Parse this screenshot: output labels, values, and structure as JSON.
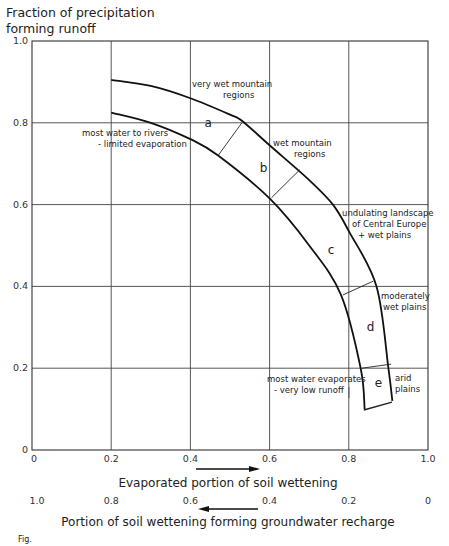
{
  "chart_data": {
    "type": "line",
    "title": "",
    "ylabel_lines": [
      "Fraction of precipitation",
      "forming runoff"
    ],
    "xlabel": "Evaporated portion of soil wettening",
    "x2label": "Portion of soil wettening forming groundwater recharge",
    "xlim": [
      0,
      1.0
    ],
    "ylim": [
      0,
      1.0
    ],
    "grid": true,
    "y_ticks": [
      "1.0",
      "0.8",
      "0.6",
      "0.4",
      "0.2",
      "0"
    ],
    "x_ticks": [
      "0",
      "0.2",
      "0.4",
      "0.6",
      "0.8",
      "1.0"
    ],
    "x2_ticks": [
      "1.0",
      "0.8",
      "0.6",
      "0.4",
      "0.2",
      "0"
    ],
    "x_arrow_direction": "right",
    "x2_arrow_direction": "left",
    "series": [
      {
        "name": "upper boundary",
        "x": [
          0.2,
          0.3,
          0.4,
          0.5,
          0.53,
          0.6,
          0.7,
          0.76,
          0.8,
          0.87,
          0.9,
          0.91
        ],
        "y": [
          0.905,
          0.89,
          0.86,
          0.82,
          0.805,
          0.745,
          0.66,
          0.6,
          0.535,
          0.4,
          0.2,
          0.12
        ]
      },
      {
        "name": "lower boundary",
        "x": [
          0.2,
          0.3,
          0.4,
          0.47,
          0.6,
          0.7,
          0.78,
          0.83,
          0.84
        ],
        "y": [
          0.825,
          0.8,
          0.76,
          0.72,
          0.615,
          0.5,
          0.38,
          0.2,
          0.1
        ]
      }
    ],
    "zones": [
      {
        "label": "a",
        "x": 0.445,
        "y": 0.79
      },
      {
        "label": "b",
        "x": 0.585,
        "y": 0.68
      },
      {
        "label": "c",
        "x": 0.755,
        "y": 0.48
      },
      {
        "label": "d",
        "x": 0.855,
        "y": 0.29
      },
      {
        "label": "e",
        "x": 0.875,
        "y": 0.155
      }
    ],
    "dividers": [
      {
        "from": [
          0.47,
          0.72
        ],
        "to": [
          0.53,
          0.8
        ]
      },
      {
        "from": [
          0.605,
          0.617
        ],
        "to": [
          0.676,
          0.685
        ]
      },
      {
        "from": [
          0.785,
          0.379
        ],
        "to": [
          0.862,
          0.413
        ]
      },
      {
        "from": [
          0.833,
          0.2
        ],
        "to": [
          0.907,
          0.21
        ]
      },
      {
        "from": [
          0.838,
          0.098
        ],
        "to": [
          0.909,
          0.117
        ]
      }
    ],
    "annotations": [
      {
        "lines": [
          "very wet mountain",
          "regions"
        ]
      },
      {
        "lines": [
          "most water to rivers",
          "- limited evaporation"
        ]
      },
      {
        "lines": [
          "wet mountain",
          "regions"
        ]
      },
      {
        "lines": [
          "undulating landscape",
          "of Central Europe",
          "+ wet plains"
        ]
      },
      {
        "lines": [
          "moderately",
          "wet plains"
        ]
      },
      {
        "lines": [
          "most water evaporates",
          "- very low runoff"
        ]
      },
      {
        "lines": [
          "arid",
          "plains"
        ]
      }
    ]
  },
  "figure_caption": "Fig."
}
